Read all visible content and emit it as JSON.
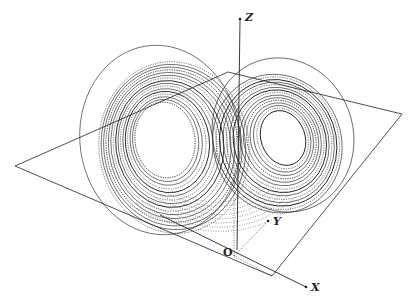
{
  "figure": {
    "axes": {
      "z_label": "Z",
      "y_label": "Y",
      "x_label": "X",
      "origin_label": "O"
    },
    "plane_corners": [
      [
        15,
        166
      ],
      [
        228,
        72
      ],
      [
        402,
        114
      ],
      [
        272,
        276
      ]
    ],
    "colors": {
      "ink": "#222222",
      "background": "#ffffff"
    }
  }
}
